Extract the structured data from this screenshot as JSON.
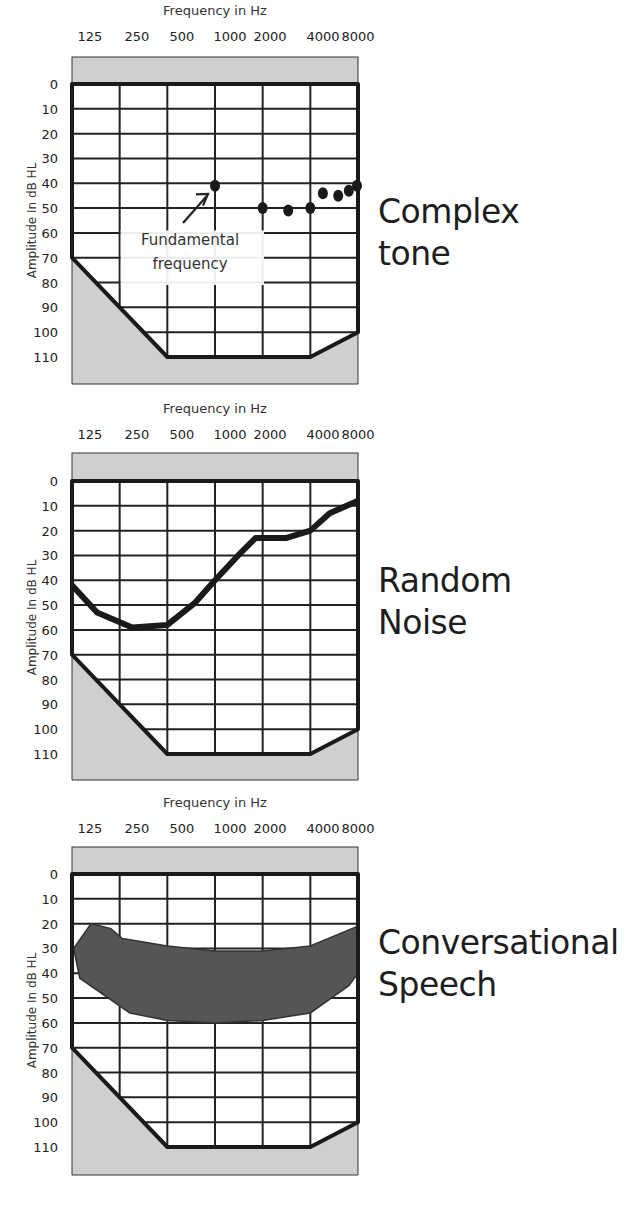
{
  "chart_data": [
    {
      "type": "scatter",
      "title": "Complex tone",
      "xlabel": "Frequency in Hz",
      "ylabel": "Amplitude In dB HL",
      "x_ticks": [
        "125",
        "250",
        "500",
        "1000",
        "2000",
        "4000",
        "8000"
      ],
      "y_ticks": [
        "0",
        "10",
        "20",
        "30",
        "40",
        "50",
        "60",
        "70",
        "80",
        "90",
        "100",
        "110"
      ],
      "ylim": [
        0,
        110
      ],
      "y_inverted": true,
      "grid": true,
      "points": [
        {
          "x": 1000,
          "y": 41
        },
        {
          "x": 2000,
          "y": 50
        },
        {
          "x": 2900,
          "y": 51
        },
        {
          "x": 4000,
          "y": 50
        },
        {
          "x": 4800,
          "y": 44
        },
        {
          "x": 6000,
          "y": 45
        },
        {
          "x": 7000,
          "y": 43
        },
        {
          "x": 8000,
          "y": 41
        }
      ],
      "annotation": {
        "text_lines": [
          "Fundamental",
          "frequency"
        ],
        "points_to": {
          "x": 1000,
          "y": 41
        }
      },
      "boundary": [
        [
          125,
          70
        ],
        [
          500,
          110
        ],
        [
          4000,
          110
        ],
        [
          8000,
          100
        ]
      ]
    },
    {
      "type": "line",
      "title": "Random Noise",
      "xlabel": "Frequency in Hz",
      "ylabel": "Amplitude In dB HL",
      "x_ticks": [
        "125",
        "250",
        "500",
        "1000",
        "2000",
        "4000",
        "8000"
      ],
      "y_ticks": [
        "0",
        "10",
        "20",
        "30",
        "40",
        "50",
        "60",
        "70",
        "80",
        "90",
        "100",
        "110"
      ],
      "ylim": [
        0,
        110
      ],
      "y_inverted": true,
      "grid": true,
      "series": [
        {
          "name": "Random Noise",
          "points": [
            {
              "x": 125,
              "y": 42
            },
            {
              "x": 180,
              "y": 53
            },
            {
              "x": 300,
              "y": 59
            },
            {
              "x": 500,
              "y": 58
            },
            {
              "x": 750,
              "y": 49
            },
            {
              "x": 1000,
              "y": 40
            },
            {
              "x": 1400,
              "y": 30
            },
            {
              "x": 1800,
              "y": 23
            },
            {
              "x": 2800,
              "y": 23
            },
            {
              "x": 4000,
              "y": 20
            },
            {
              "x": 5300,
              "y": 13
            },
            {
              "x": 8000,
              "y": 8
            }
          ]
        }
      ],
      "boundary": [
        [
          125,
          70
        ],
        [
          500,
          110
        ],
        [
          4000,
          110
        ],
        [
          8000,
          100
        ]
      ]
    },
    {
      "type": "area",
      "title": "Conversational Speech",
      "xlabel": "Frequency in Hz",
      "ylabel": "Amplitude In dB HL",
      "x_ticks": [
        "125",
        "250",
        "500",
        "1000",
        "2000",
        "4000",
        "8000"
      ],
      "y_ticks": [
        "0",
        "10",
        "20",
        "30",
        "40",
        "50",
        "60",
        "70",
        "80",
        "90",
        "100",
        "110"
      ],
      "ylim": [
        0,
        110
      ],
      "y_inverted": true,
      "grid": true,
      "series": [
        {
          "name": "Speech banana",
          "upper": [
            {
              "x": 128,
              "y": 30
            },
            {
              "x": 165,
              "y": 20
            },
            {
              "x": 220,
              "y": 22
            },
            {
              "x": 260,
              "y": 26
            },
            {
              "x": 500,
              "y": 29
            },
            {
              "x": 1000,
              "y": 31
            },
            {
              "x": 2000,
              "y": 31
            },
            {
              "x": 4000,
              "y": 29
            },
            {
              "x": 8000,
              "y": 21
            }
          ],
          "lower": [
            {
              "x": 8000,
              "y": 40
            },
            {
              "x": 7000,
              "y": 45
            },
            {
              "x": 4000,
              "y": 56
            },
            {
              "x": 2000,
              "y": 59
            },
            {
              "x": 1000,
              "y": 60
            },
            {
              "x": 500,
              "y": 59
            },
            {
              "x": 290,
              "y": 56
            },
            {
              "x": 140,
              "y": 42
            },
            {
              "x": 128,
              "y": 30
            }
          ]
        }
      ],
      "boundary": [
        [
          125,
          70
        ],
        [
          500,
          110
        ],
        [
          4000,
          110
        ],
        [
          8000,
          100
        ]
      ]
    }
  ],
  "panels": [
    {
      "label_lines": [
        "Complex",
        "tone"
      ]
    },
    {
      "label_lines": [
        "Random",
        "Noise"
      ]
    },
    {
      "label_lines": [
        "Conversational",
        "Speech"
      ]
    }
  ],
  "colors": {
    "grid": "#222222",
    "shade": "#cfcfcf",
    "speech_fill": "#555555",
    "ink": "#1e1e1e"
  }
}
